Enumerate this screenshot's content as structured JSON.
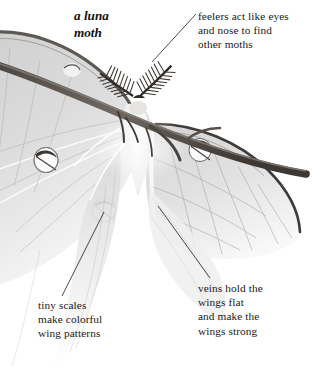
{
  "figure": {
    "subject": "luna moth",
    "medium": "pencil illustration",
    "title": "a luna\nmoth",
    "background_color": "#ffffff",
    "ink_color": "#1a1a1a"
  },
  "callouts": [
    {
      "id": "feelers",
      "text": "feelers act like eyes\nand nose to find\nother moths",
      "target": "antennae"
    },
    {
      "id": "scales",
      "text": "tiny scales\nmake colorful\nwing patterns",
      "target": "forewing-eyespot"
    },
    {
      "id": "veins",
      "text": "veins hold the\nwings flat\nand make the\nwings strong",
      "target": "hindwing-veins"
    }
  ],
  "illustration_parts": {
    "branch": "diagonal twig",
    "antennae": "feathery plumed antennae",
    "eyespots": 4,
    "wings": "pale luna moth wings with tails"
  }
}
